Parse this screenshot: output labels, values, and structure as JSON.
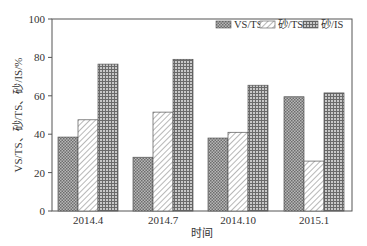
{
  "chart_data": {
    "type": "bar",
    "title": "",
    "xlabel": "时间",
    "ylabel": "VS/TS、砂/TS、砂/IS/%",
    "ylim": [
      0,
      100
    ],
    "yticks": [
      0,
      20,
      40,
      60,
      80,
      100
    ],
    "categories": [
      "2014.4",
      "2014.7",
      "2014.10",
      "2015.1"
    ],
    "series": [
      {
        "name": "VS/TS",
        "pattern": "crosshatch-dense",
        "values": [
          38.5,
          28,
          38,
          59.5
        ]
      },
      {
        "name": "砂/TS",
        "pattern": "diagonal-hatch",
        "values": [
          47.5,
          51.5,
          41,
          26
        ]
      },
      {
        "name": "砂/IS",
        "pattern": "grid-dense",
        "values": [
          76.5,
          79,
          65.5,
          61.5
        ]
      }
    ],
    "grid": false,
    "legend_position": "top-right"
  },
  "legend": {
    "items": [
      "VS/TS",
      "砂/TS",
      "砂/IS"
    ]
  },
  "axis": {
    "x_title": "时间",
    "y_title": "VS/TS、砂/TS、砂/IS/%"
  }
}
